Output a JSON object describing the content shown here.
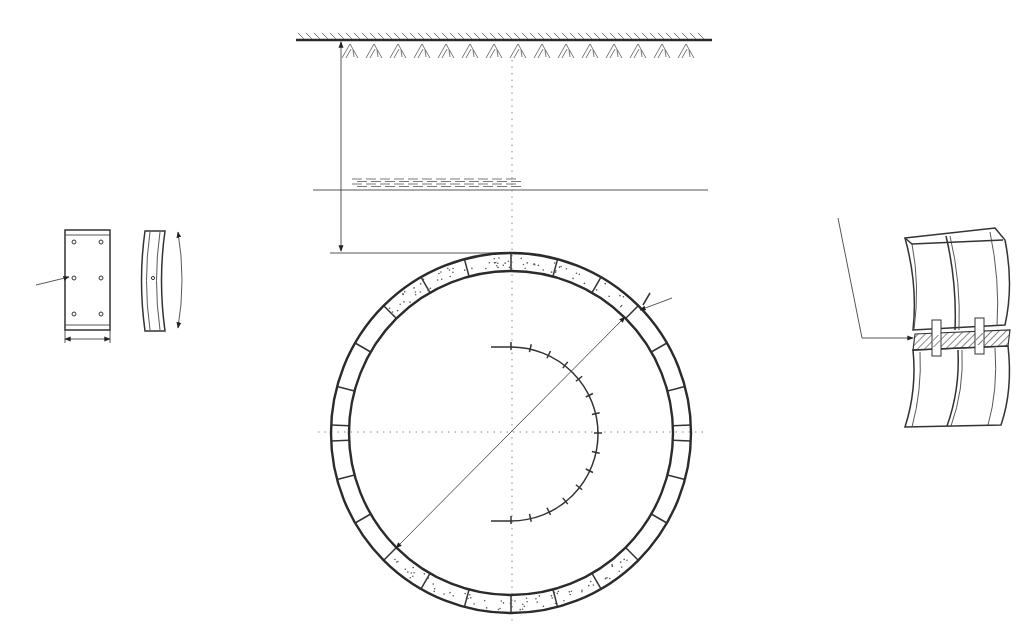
{
  "figure": {
    "title": "",
    "colors": {
      "line": "#2b2b2b",
      "background": "#ffffff",
      "axis": "#888888"
    }
  },
  "ground_surface": {
    "label": ""
  },
  "water_table": {
    "label": ""
  },
  "depth_dimension": {
    "label": ""
  },
  "lining_ring": {
    "segment_count": 24,
    "stippled_segments": "crown and invert",
    "diameter_label": "",
    "thickness_label": ""
  },
  "angle_arc": {
    "span_degrees": 180,
    "tick_count": 15,
    "label": ""
  },
  "segment_detail": {
    "label": "",
    "bolt_holes": 6,
    "width_label": "",
    "arc_length_label": ""
  },
  "joint_detail": {
    "label": ""
  },
  "icons": {
    "ground": "ground-hatch-icon",
    "water": "water-table-icon",
    "arrow": "dimension-arrow-icon"
  }
}
